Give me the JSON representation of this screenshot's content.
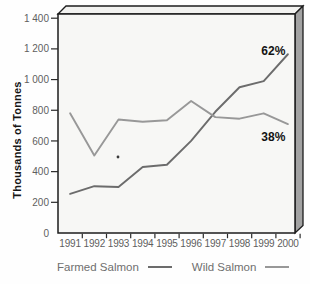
{
  "chart_data": {
    "type": "line",
    "title": "",
    "ylabel": "Thousands of Tonnes",
    "xlabel": "",
    "ylim": [
      0,
      1400
    ],
    "y_tick_interval": 200,
    "y_tick_labels": [
      "0",
      "200",
      "400",
      "600",
      "800",
      "1 000",
      "1 200",
      "1 400"
    ],
    "categories": [
      "1991",
      "1992",
      "1993",
      "1994",
      "1995",
      "1996",
      "1997",
      "1998",
      "1999",
      "2000"
    ],
    "grid": false,
    "legend_position": "bottom",
    "series": [
      {
        "name": "Farmed Salmon",
        "color": "#6c6c6c",
        "values": [
          255,
          305,
          300,
          430,
          445,
          600,
          790,
          950,
          990,
          1165
        ],
        "final_share": "62%"
      },
      {
        "name": "Wild Salmon",
        "color": "#989898",
        "values": [
          780,
          505,
          740,
          725,
          735,
          860,
          755,
          745,
          780,
          710
        ],
        "final_share": "38%"
      }
    ],
    "annotations": [
      {
        "text": "62%",
        "x_index": 8.4,
        "value": 1190
      },
      {
        "text": "38%",
        "x_index": 8.4,
        "value": 625
      }
    ]
  }
}
